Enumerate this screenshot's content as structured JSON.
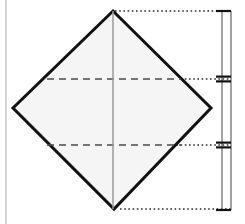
{
  "figure": {
    "background_color": "#ffffff",
    "canvas": {
      "width": 245,
      "height": 224
    }
  },
  "colors": {
    "outline": "#111111",
    "fill": "#f5f5f5",
    "fold_line": "#4a4a4a",
    "center_line": "#9a9a9a",
    "extension_line": "#2b2b2b",
    "dimension_line": "#6e6e6e",
    "margin_rule": "#b8b8b8",
    "tick": "#111111"
  },
  "chart_data": {
    "type": "diagram",
    "shape": {
      "name": "square-rotated-45",
      "label": "diamond",
      "vertices": [
        {
          "name": "top",
          "x": 113,
          "y": 11
        },
        {
          "name": "right",
          "x": 211,
          "y": 108
        },
        {
          "name": "bottom",
          "x": 114,
          "y": 209
        },
        {
          "name": "left",
          "x": 13,
          "y": 108
        }
      ],
      "fill": "#f5f5f5",
      "stroke": "#111111",
      "stroke_width": 3
    },
    "fold_lines": [
      {
        "name": "upper-fold",
        "style": "dashed",
        "y": 79,
        "x1": 47,
        "x2": 181
      },
      {
        "name": "lower-fold",
        "style": "dashed",
        "y": 145,
        "x1": 47,
        "x2": 181
      }
    ],
    "center_line": {
      "name": "vertical-axis",
      "style": "solid",
      "x": 113,
      "y1": 11,
      "y2": 209
    },
    "extension_lines": [
      {
        "name": "extension-top",
        "style": "dotted",
        "y": 11,
        "x1": 115,
        "x2": 231
      },
      {
        "name": "extension-upper-fold",
        "style": "dotted",
        "y": 79,
        "x1": 168,
        "x2": 231
      },
      {
        "name": "extension-lower-fold",
        "style": "dotted",
        "y": 145,
        "x1": 168,
        "x2": 231
      },
      {
        "name": "extension-bottom",
        "style": "dotted",
        "y": 209,
        "x1": 120,
        "x2": 231
      }
    ],
    "dimension_lines": [
      {
        "name": "dimension-inner",
        "x": 222,
        "y1": 11,
        "y2": 210,
        "label": ""
      },
      {
        "name": "dimension-outer",
        "x": 231,
        "y1": 11,
        "y2": 210,
        "label": ""
      }
    ],
    "dimension_ticks": [
      {
        "name": "tick-top",
        "y": 11,
        "kind": "single",
        "x1": 216,
        "x2": 231
      },
      {
        "name": "tick-upper-fold",
        "y": 79,
        "kind": "double",
        "x1": 216,
        "x2": 231
      },
      {
        "name": "tick-lower-fold",
        "y": 145,
        "kind": "double",
        "x1": 216,
        "x2": 231
      },
      {
        "name": "tick-bottom",
        "y": 210,
        "kind": "single",
        "x1": 216,
        "x2": 231
      }
    ],
    "segments": [
      {
        "name": "segment-upper",
        "from_y": 11,
        "to_y": 79,
        "height_px": 68
      },
      {
        "name": "segment-middle",
        "from_y": 79,
        "to_y": 145,
        "height_px": 66
      },
      {
        "name": "segment-lower",
        "from_y": 145,
        "to_y": 210,
        "height_px": 65
      }
    ],
    "margin_rule": {
      "name": "page-margin-rule",
      "x": 6,
      "y1": 0,
      "y2": 224
    },
    "annotations": [],
    "labels": []
  }
}
